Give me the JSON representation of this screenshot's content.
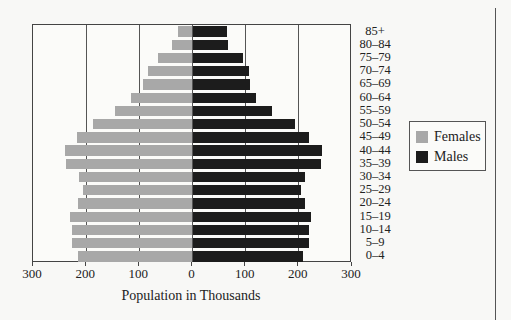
{
  "chart_data": {
    "type": "bar",
    "orientation": "horizontal",
    "subtype": "population-pyramid",
    "title": "",
    "xlabel": "Population in Thousands",
    "ylabel": "",
    "xlim": [
      -300,
      300
    ],
    "x_ticks": [
      -300,
      -200,
      -100,
      0,
      100,
      200,
      300
    ],
    "x_tick_labels": [
      "300",
      "200",
      "100",
      "0",
      "100",
      "200",
      "300"
    ],
    "grid": true,
    "legend_position": "right",
    "categories": [
      "85+",
      "80–84",
      "75–79",
      "70–74",
      "65–69",
      "60–64",
      "55–59",
      "50–54",
      "45–49",
      "40–44",
      "35–39",
      "30–34",
      "25–29",
      "20–24",
      "15–19",
      "10–14",
      "5–9",
      "0–4"
    ],
    "series": [
      {
        "name": "Females",
        "side": "left",
        "color": "#a8a8a8",
        "values": [
          28,
          39,
          65,
          84,
          94,
          115,
          145,
          187,
          217,
          240,
          238,
          213,
          206,
          216,
          230,
          226,
          226,
          216
        ]
      },
      {
        "name": "Males",
        "side": "right",
        "color": "#1c1c1c",
        "values": [
          65,
          66,
          95,
          106,
          109,
          120,
          150,
          192,
          220,
          243,
          242,
          211,
          204,
          211,
          222,
          219,
          219,
          207
        ]
      }
    ]
  },
  "legend": {
    "items": [
      {
        "label": "Females",
        "color": "#a8a8a8"
      },
      {
        "label": "Males",
        "color": "#1c1c1c"
      }
    ]
  },
  "axis": {
    "xlabel": "Population in Thousands"
  }
}
